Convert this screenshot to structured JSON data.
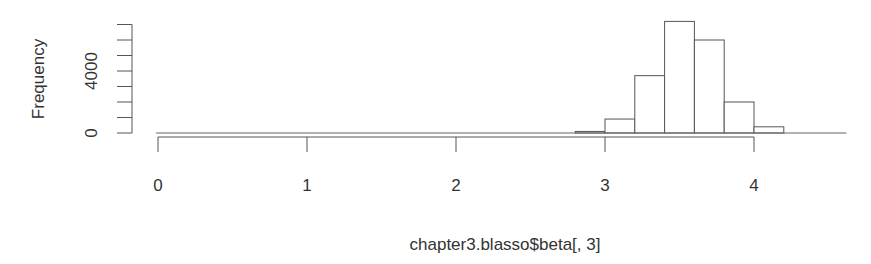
{
  "chart_data": {
    "type": "bar",
    "subtype": "histogram",
    "title": "",
    "xlabel": "chapter3.blasso$beta[, 3]",
    "ylabel": "Frequency",
    "x_ticks": [
      0,
      1,
      2,
      3,
      4
    ],
    "y_ticks": [
      0,
      1000,
      2000,
      3000,
      4000,
      5000,
      6000,
      7000
    ],
    "y_tick_labels": [
      {
        "value": 0,
        "label": "0"
      },
      {
        "value": 4000,
        "label": "4000"
      }
    ],
    "xlim": [
      0,
      4.6
    ],
    "ylim": [
      0,
      7000
    ],
    "bin_width": 0.2,
    "bins": [
      {
        "x0": 0.0,
        "x1": 2.8,
        "count": 0
      },
      {
        "x0": 2.8,
        "x1": 3.0,
        "count": 100
      },
      {
        "x0": 3.0,
        "x1": 3.2,
        "count": 900
      },
      {
        "x0": 3.2,
        "x1": 3.4,
        "count": 3700
      },
      {
        "x0": 3.4,
        "x1": 3.6,
        "count": 7200
      },
      {
        "x0": 3.6,
        "x1": 3.8,
        "count": 6000
      },
      {
        "x0": 3.8,
        "x1": 4.0,
        "count": 2000
      },
      {
        "x0": 4.0,
        "x1": 4.2,
        "count": 400
      },
      {
        "x0": 4.2,
        "x1": 4.6,
        "count": 0
      }
    ],
    "categories": [
      "2.8-3.0",
      "3.0-3.2",
      "3.2-3.4",
      "3.4-3.6",
      "3.6-3.8",
      "3.8-4.0",
      "4.0-4.2"
    ],
    "values": [
      100,
      900,
      3700,
      7200,
      6000,
      2000,
      400
    ],
    "grid": false,
    "legend": null,
    "colors": {
      "bar_fill": "#ffffff",
      "bar_stroke": "#555555",
      "axis": "#555555",
      "text": "#333333"
    }
  },
  "axes": {
    "xlabel": "chapter3.blasso$beta[, 3]",
    "ylabel": "Frequency"
  }
}
